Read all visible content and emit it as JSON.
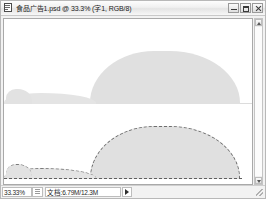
{
  "window": {
    "title": "食品广告1.psd @ 33.3% (字1, RGB/8)",
    "icon": "document-icon",
    "controls": {
      "minimize_label": "最小化",
      "maximize_label": "最大化",
      "close_label": "关闭"
    }
  },
  "canvas": {
    "background_color": "#ffffff",
    "shape_fill_color": "#e0e0e0",
    "marquee_color": "#6e6e6e",
    "upper_layer_name": "合并效果",
    "lower_layer_name": "选区图层"
  },
  "scrollbar": {
    "up_arrow": "scroll-up-arrow",
    "down_arrow": "scroll-down-arrow"
  },
  "statusbar": {
    "zoom": "33.33%",
    "grip": "resize-grip",
    "doc_size": "文档:6.79M/12.3M",
    "menu_arrow": "status-menu-arrow",
    "resize_handle": "window-resize-handle"
  }
}
